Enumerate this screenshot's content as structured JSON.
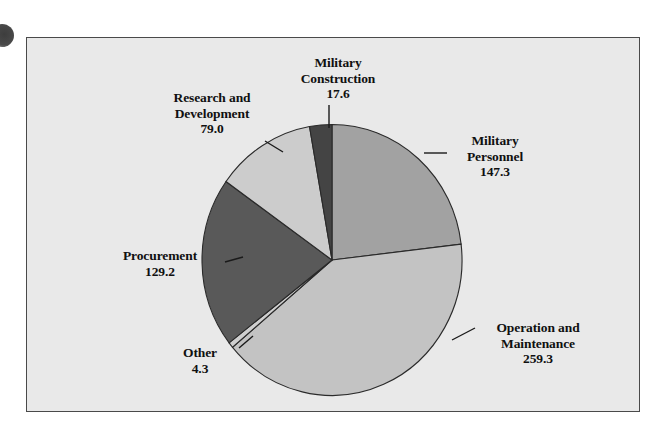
{
  "figure": {
    "background_color": "#ffffff",
    "panel_color": "#e9e9e9",
    "border_color": "#4a4a4a"
  },
  "chart_data": {
    "type": "pie",
    "title": "",
    "subtitle": "",
    "xlabel": "",
    "ylabel": "",
    "legend_position": "none",
    "grid": false,
    "total": 636.7,
    "units": "billions of dollars",
    "start_angle_deg": 0,
    "direction": "clockwise",
    "categories": [
      "Military Personnel",
      "Operation and Maintenance",
      "Other",
      "Procurement",
      "Research and Development",
      "Military Construction"
    ],
    "values": [
      147.3,
      259.3,
      4.3,
      129.2,
      79.0,
      17.6
    ],
    "colors": [
      "#a2a2a2",
      "#c3c3c3",
      "#cfcfcf",
      "#595959",
      "#cccccc",
      "#444444"
    ],
    "slices": [
      {
        "name": "Military Personnel",
        "label_line1": "Military",
        "label_line2": "Personnel",
        "value_text": "147.3",
        "value": 147.3,
        "color": "#a2a2a2"
      },
      {
        "name": "Operation and Maintenance",
        "label_line1": "Operation and",
        "label_line2": "Maintenance",
        "value_text": "259.3",
        "value": 259.3,
        "color": "#c3c3c3"
      },
      {
        "name": "Other",
        "label_line1": "Other",
        "label_line2": "",
        "value_text": "4.3",
        "value": 4.3,
        "color": "#cfcfcf"
      },
      {
        "name": "Procurement",
        "label_line1": "Procurement",
        "label_line2": "",
        "value_text": "129.2",
        "value": 129.2,
        "color": "#595959"
      },
      {
        "name": "Research and Development",
        "label_line1": "Research and",
        "label_line2": "Development",
        "value_text": "79.0",
        "value": 79.0,
        "color": "#cccccc"
      },
      {
        "name": "Military Construction",
        "label_line1": "Military",
        "label_line2": "Construction",
        "value_text": "17.6",
        "value": 17.6,
        "color": "#444444"
      }
    ]
  },
  "labels": {
    "military_construction": {
      "line1": "Military",
      "line2": "Construction",
      "value": "17.6"
    },
    "research_development": {
      "line1": "Research and",
      "line2": "Development",
      "value": "79.0"
    },
    "military_personnel": {
      "line1": "Military",
      "line2": "Personnel",
      "value": "147.3"
    },
    "operation_maintenance": {
      "line1": "Operation and",
      "line2": "Maintenance",
      "value": "259.3"
    },
    "procurement": {
      "line1": "Procurement",
      "line2": "",
      "value": "129.2"
    },
    "other": {
      "line1": "Other",
      "line2": "",
      "value": "4.3"
    }
  }
}
